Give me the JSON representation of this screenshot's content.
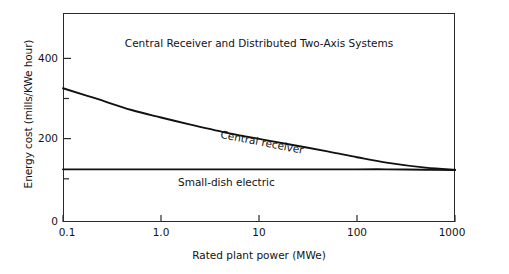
{
  "chart_data": {
    "type": "line",
    "title": "Central Receiver and Distributed Two-Axis Systems",
    "xlabel": "Rated plant power (MWe)",
    "ylabel": "Energy cost (mills/KWe hour)",
    "xscale": "log",
    "xlim": [
      0.1,
      1000
    ],
    "ylim": [
      0,
      500
    ],
    "grid": false,
    "legend": "inline-annotations",
    "xticks": [
      "0.1",
      "1.0",
      "10",
      "100",
      "1000"
    ],
    "xtick_values": [
      0.1,
      1.0,
      10,
      100,
      1000
    ],
    "yticks": [
      "0",
      "200",
      "400"
    ],
    "ytick_values": [
      0,
      200,
      400
    ],
    "yticks_minor": [
      100,
      300
    ],
    "series": [
      {
        "name": "Central receiver",
        "x": [
          0.1,
          0.2,
          0.5,
          1.0,
          2.0,
          5.0,
          10,
          20,
          50,
          100,
          200,
          500,
          1000
        ],
        "values": [
          320,
          298,
          268,
          250,
          233,
          212,
          199,
          186,
          169,
          155,
          142,
          130,
          125
        ]
      },
      {
        "name": "Small-dish electric",
        "x": [
          0.1,
          1.0,
          10,
          100,
          200,
          500,
          1000
        ],
        "values": [
          126,
          126,
          126,
          126,
          126,
          125,
          124
        ]
      }
    ],
    "annotations": [
      {
        "text": "Central receiver",
        "x": 20,
        "y": 195,
        "rotation": -11
      },
      {
        "text": "Small-dish electric",
        "x": 3.5,
        "y": 108,
        "rotation": 0
      }
    ]
  },
  "figure": {
    "title": "Central Receiver and Distributed Two-Axis Systems",
    "x_axis_title": "Rated plant power (MWe)",
    "y_axis_title": "Energy cost (mills/KWe hour)",
    "x_tick_labels": [
      "0.1",
      "1.0",
      "10",
      "100",
      "1000"
    ],
    "y_tick_labels": [
      "400",
      "200",
      "0"
    ],
    "curve_labels": {
      "central_receiver": "Central receiver",
      "small_dish": "Small-dish electric"
    },
    "colors": {
      "background": "#ffffff",
      "axis": "#2a2a2a",
      "curve": "#111111",
      "text": "#121212"
    }
  }
}
